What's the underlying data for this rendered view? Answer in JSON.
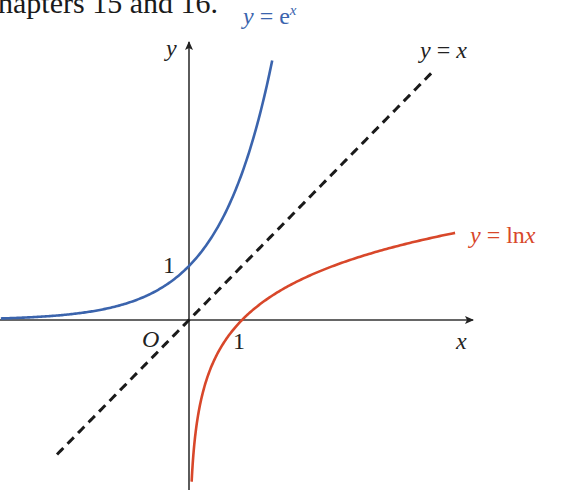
{
  "header": {
    "text": "hapters 15 and 16."
  },
  "chart_data": {
    "type": "line",
    "title": "",
    "xlabel": "x",
    "ylabel": "y",
    "origin_label": "O",
    "tick_labels": {
      "x": [
        "1"
      ],
      "y": [
        "1"
      ]
    },
    "xlim": [
      -3.55,
      5.2
    ],
    "ylim": [
      -3.0,
      5.15
    ],
    "grid": false,
    "legend": "inline labels",
    "series": [
      {
        "name": "y = e^x",
        "label": "y = e",
        "label_sup": "x",
        "color": "#3b64ad",
        "style": "solid",
        "x": [
          -3.55,
          -3,
          -2,
          -1,
          0,
          0.5,
          1,
          1.25,
          1.5,
          1.57
        ],
        "y": [
          0.03,
          0.05,
          0.14,
          0.37,
          1,
          1.65,
          2.72,
          3.49,
          4.48,
          4.8
        ]
      },
      {
        "name": "y = x",
        "label": "y = x",
        "color": "#1a1a1a",
        "style": "dashed",
        "x": [
          -2.49,
          4.57
        ],
        "y": [
          -2.49,
          4.57
        ]
      },
      {
        "name": "y = ln x",
        "label": "y = ln x",
        "color": "#d8472a",
        "style": "solid",
        "x": [
          0.05,
          0.1,
          0.25,
          0.5,
          1,
          2,
          3,
          4,
          5.02
        ],
        "y": [
          -3.0,
          -2.3,
          -1.39,
          -0.69,
          0,
          0.69,
          1.1,
          1.39,
          1.61
        ]
      }
    ]
  }
}
